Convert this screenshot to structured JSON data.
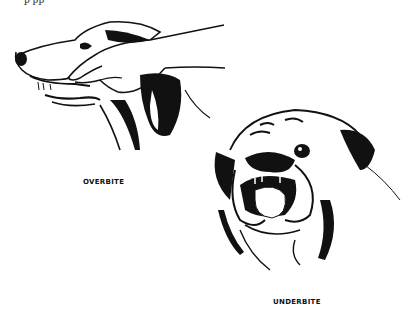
{
  "figures": [
    {
      "id": "overbite",
      "caption": "OVERBITE",
      "depicts": "side profile of a long-muzzled dog with a hand lifting the upper lip to show the upper jaw overlapping the lower jaw"
    },
    {
      "id": "underbite",
      "caption": "UNDERBITE",
      "depicts": "front view of a bulldog head with the lower jaw protruding past the upper jaw"
    }
  ],
  "top_fragment": "p        pp",
  "colors": {
    "ink": "#111111",
    "paper": "#ffffff"
  }
}
